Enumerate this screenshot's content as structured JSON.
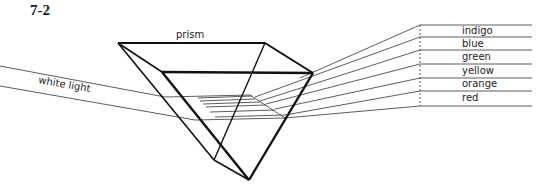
{
  "figure": {
    "number": "7-2",
    "prism_label": "prism",
    "input_label": "white light",
    "spectrum": [
      {
        "name": "indigo"
      },
      {
        "name": "blue"
      },
      {
        "name": "green"
      },
      {
        "name": "yellow"
      },
      {
        "name": "orange"
      },
      {
        "name": "red"
      }
    ]
  },
  "colors": {
    "line": "#111111",
    "thin_line": "#333333"
  }
}
